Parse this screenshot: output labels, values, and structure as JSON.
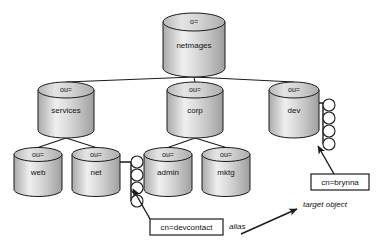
{
  "diagram": {
    "colors": {
      "background": "#ffffff",
      "line": "#1b1b1b",
      "cylinder_light": "#f2f2f2",
      "cylinder_mid": "#d9d9d9",
      "cylinder_dark": "#a8a8a8",
      "cylinder_top": "#cfcfcf"
    },
    "nodes": [
      {
        "id": "root",
        "type_label": "o=",
        "name_label": "netmages",
        "x": 194,
        "y": 45,
        "rx": 31,
        "ry": 9,
        "h": 46
      },
      {
        "id": "services",
        "type_label": "ou=",
        "name_label": "services",
        "x": 66,
        "y": 110,
        "rx": 28,
        "ry": 8,
        "h": 40
      },
      {
        "id": "corp",
        "type_label": "ou=",
        "name_label": "corp",
        "x": 195,
        "y": 110,
        "rx": 28,
        "ry": 8,
        "h": 40
      },
      {
        "id": "dev",
        "type_label": "ou=",
        "name_label": "dev",
        "x": 294,
        "y": 110,
        "rx": 25,
        "ry": 8,
        "h": 40
      },
      {
        "id": "web",
        "type_label": "ou=",
        "name_label": "web",
        "x": 38,
        "y": 172,
        "rx": 24,
        "ry": 7,
        "h": 35
      },
      {
        "id": "net",
        "type_label": "ou=",
        "name_label": "net",
        "x": 96,
        "y": 172,
        "rx": 24,
        "ry": 7,
        "h": 35
      },
      {
        "id": "admin",
        "type_label": "ou=",
        "name_label": "admin",
        "x": 168,
        "y": 172,
        "rx": 24,
        "ry": 7,
        "h": 35
      },
      {
        "id": "mktg",
        "type_label": "ou=",
        "name_label": "mktg",
        "x": 226,
        "y": 172,
        "rx": 24,
        "ry": 7,
        "h": 35
      }
    ],
    "leaf_chains": [
      {
        "id": "net-leaves",
        "attached_to": "net",
        "count": 4,
        "x": 131,
        "y_start": 162,
        "spacing": 13,
        "r": 6,
        "stem_from_x": 120,
        "stem_y": 162
      },
      {
        "id": "dev-leaves",
        "attached_to": "dev",
        "count": 4,
        "x": 323,
        "y_start": 105,
        "spacing": 13,
        "r": 6,
        "stem_from_x": 319,
        "stem_y": 103
      }
    ],
    "edges": [
      {
        "from": "root",
        "to": "services"
      },
      {
        "from": "root",
        "to": "corp"
      },
      {
        "from": "root",
        "to": "dev"
      },
      {
        "from": "services",
        "to": "web"
      },
      {
        "from": "services",
        "to": "net"
      },
      {
        "from": "corp",
        "to": "admin"
      },
      {
        "from": "corp",
        "to": "mktg"
      }
    ],
    "callouts": [
      {
        "id": "devcontact",
        "text": "cn=devcontact",
        "box": {
          "x": 150,
          "y": 219,
          "w": 73,
          "h": 16
        },
        "arrow": {
          "x1": 150,
          "y1": 219,
          "x2": 133,
          "y2": 189
        }
      },
      {
        "id": "brynna",
        "text": "cn=brynna",
        "box": {
          "x": 311,
          "y": 174,
          "w": 58,
          "h": 16
        },
        "arrow": {
          "x1": 334,
          "y1": 174,
          "x2": 318,
          "y2": 146
        }
      }
    ],
    "annotations": [
      {
        "id": "alias",
        "text": "alias",
        "x": 229,
        "y": 227
      },
      {
        "id": "target-object",
        "text": "target object",
        "x": 303,
        "y": 205
      }
    ],
    "relation_arrow": {
      "id": "alias-to-target",
      "label_from": "alias",
      "label_to": "target object",
      "x1": 241,
      "y1": 234,
      "x2": 297,
      "y2": 209
    }
  }
}
